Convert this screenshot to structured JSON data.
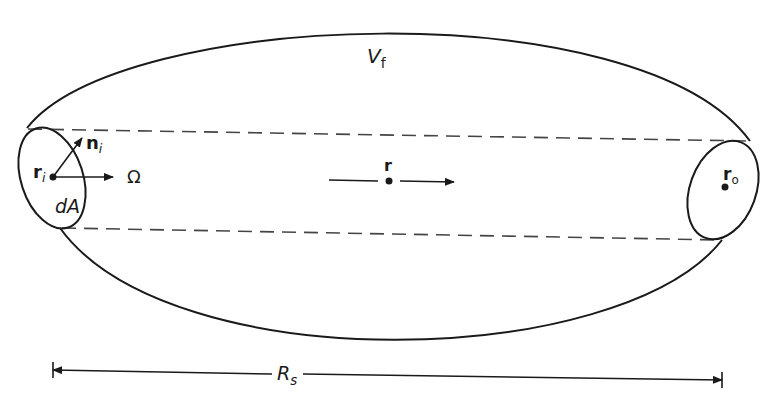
{
  "diagram": {
    "type": "geometry",
    "colors": {
      "stroke": "#1a1a1a",
      "background": "#ffffff"
    },
    "labels": {
      "volume": {
        "main": "V",
        "sub": "f"
      },
      "input_point": {
        "main": "r",
        "sub": "i"
      },
      "normal": {
        "main": "n",
        "sub": "i"
      },
      "direction": "Ω",
      "area": "dA",
      "field_point": "r",
      "output_point": {
        "main": "r",
        "sub": "o"
      },
      "distance": {
        "main": "R",
        "sub": "s"
      }
    }
  }
}
